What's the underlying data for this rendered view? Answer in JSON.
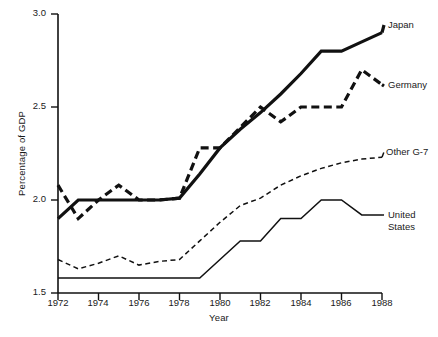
{
  "chart_data": {
    "type": "line",
    "title": "",
    "xlabel": "Year",
    "ylabel": "Percentage of GDP",
    "xlim": [
      1972,
      1988
    ],
    "ylim": [
      1.5,
      3.0
    ],
    "grid": false,
    "legend_position": "right-inline",
    "x": [
      1972,
      1973,
      1974,
      1975,
      1976,
      1977,
      1978,
      1979,
      1980,
      1981,
      1982,
      1983,
      1984,
      1985,
      1986,
      1987,
      1988
    ],
    "xticks": [
      "1972",
      "1974",
      "1976",
      "1978",
      "1980",
      "1982",
      "1984",
      "1986",
      "1988"
    ],
    "xtick_values": [
      1972,
      1974,
      1976,
      1978,
      1980,
      1982,
      1984,
      1986,
      1988
    ],
    "yticks": [
      "1.5",
      "2.0",
      "2.5",
      "3.0"
    ],
    "ytick_values": [
      1.5,
      2.0,
      2.5,
      3.0
    ],
    "series": [
      {
        "name": "Japan",
        "style": "solid-thick",
        "values": [
          1.9,
          2.0,
          2.0,
          2.0,
          2.0,
          2.0,
          2.01,
          2.14,
          2.28,
          2.38,
          2.47,
          2.57,
          2.68,
          2.8,
          2.8,
          2.85,
          2.9
        ]
      },
      {
        "name": "Germany",
        "style": "dashed-thick",
        "values": [
          2.08,
          1.9,
          2.0,
          2.08,
          2.0,
          2.0,
          2.01,
          2.28,
          2.28,
          2.39,
          2.5,
          2.42,
          2.5,
          2.5,
          2.5,
          2.7,
          2.62
        ]
      },
      {
        "name": "Other G-7",
        "style": "dashed-thin",
        "values": [
          1.68,
          1.63,
          1.66,
          1.7,
          1.65,
          1.67,
          1.68,
          1.78,
          1.88,
          1.97,
          2.01,
          2.08,
          2.13,
          2.17,
          2.2,
          2.22,
          2.23
        ]
      },
      {
        "name": "United States",
        "style": "solid-thin",
        "values": [
          1.58,
          1.58,
          1.58,
          1.58,
          1.58,
          1.58,
          1.58,
          1.58,
          1.68,
          1.78,
          1.78,
          1.9,
          1.9,
          2.0,
          2.0,
          1.92,
          1.92
        ]
      }
    ]
  },
  "labels": {
    "japan": "Japan",
    "germany": "Germany",
    "other_g7": "Other G-7",
    "united_states": "United\nStates"
  },
  "axis": {
    "y_title": "Percentage of GDP",
    "x_title": "Year",
    "y_ticks": [
      "3.0",
      "2.5",
      "2.0",
      "1.5"
    ],
    "x_ticks": [
      "1972",
      "1974",
      "1976",
      "1978",
      "1980",
      "1982",
      "1984",
      "1986",
      "1988"
    ]
  },
  "colors": {
    "line": "#111111",
    "background": "#ffffff",
    "text": "#1a1a1a"
  }
}
